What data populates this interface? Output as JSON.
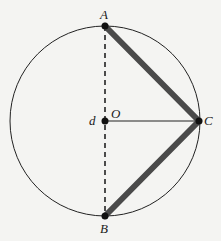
{
  "diagram": {
    "type": "circle-inscribed-triangle",
    "circle": {
      "center": "O",
      "cx": 105,
      "cy": 121,
      "r": 95
    },
    "points": {
      "A": {
        "label": "A",
        "x": 105,
        "y": 26
      },
      "B": {
        "label": "B",
        "x": 105,
        "y": 216
      },
      "C": {
        "label": "C",
        "x": 199,
        "y": 121
      },
      "O": {
        "label": "O",
        "x": 105,
        "y": 121
      }
    },
    "extra_label": "d",
    "segments": [
      {
        "from": "A",
        "to": "C",
        "style": "thick"
      },
      {
        "from": "C",
        "to": "B",
        "style": "thick"
      },
      {
        "from": "A",
        "to": "B",
        "style": "dashed"
      },
      {
        "from": "O",
        "to": "C",
        "style": "thin"
      }
    ],
    "colors": {
      "thick": "#4a4a4a",
      "line": "#222222",
      "background": "#f4f4f2"
    }
  }
}
